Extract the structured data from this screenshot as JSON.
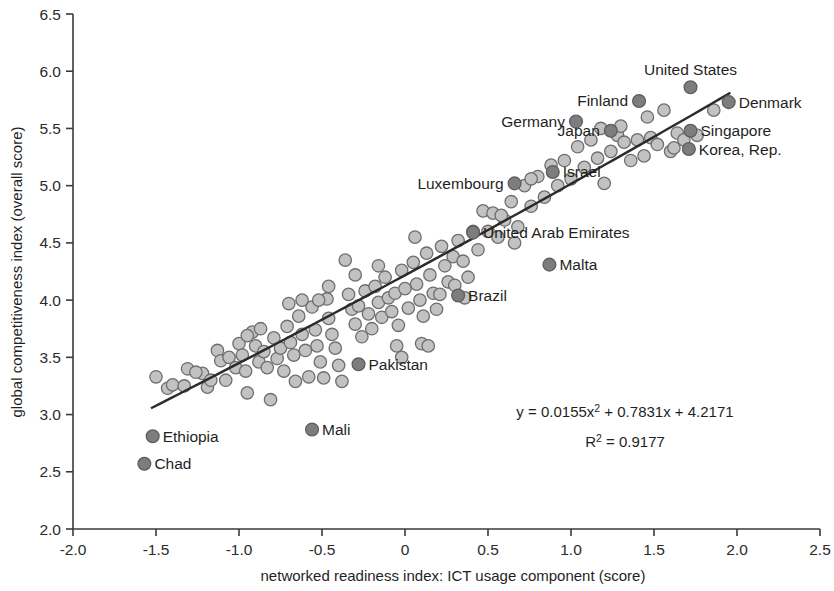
{
  "chart_data": {
    "type": "scatter",
    "title": "",
    "xlabel": "networked readiness index: ICT usage component (score)",
    "ylabel": "global competitiveness index (overall score)",
    "xlim": [
      -2.0,
      2.5
    ],
    "ylim": [
      2.0,
      6.5
    ],
    "xticks": [
      "-2.0",
      "-1.5",
      "-1.0",
      "-0.5",
      "0",
      "0.5",
      "1.0",
      "1.5",
      "2.0",
      "2.5"
    ],
    "xtick_values": [
      -2.0,
      -1.5,
      -1.0,
      -0.5,
      0,
      0.5,
      1.0,
      1.5,
      2.0,
      2.5
    ],
    "yticks": [
      "2.0",
      "2.5",
      "3.0",
      "3.5",
      "4.0",
      "4.5",
      "5.0",
      "5.5",
      "6.0",
      "6.5"
    ],
    "ytick_values": [
      2.0,
      2.5,
      3.0,
      3.5,
      4.0,
      4.5,
      5.0,
      5.5,
      6.0,
      6.5
    ],
    "grid": false,
    "legend": "none",
    "marker_color": "#c2c2c2",
    "marker_edge_color": "#6e6e6e",
    "highlight_color": "#7d7d7d",
    "trendline_color": "#2b2b2b",
    "trendline": {
      "equation": "y = 0.0155x",
      "equation_sup": "2",
      "equation_rest": " + 0.7831x + 4.2171",
      "r2_label": "R",
      "r2_sup": "2",
      "r2_value": " = 0.9177",
      "x_start": -1.53,
      "x_end": 1.96,
      "coefficients": {
        "a": 0.0155,
        "b": 0.7831,
        "c": 4.2171
      },
      "r_squared": 0.9177
    },
    "labeled_points": [
      {
        "label": "United States",
        "x": 1.72,
        "y": 5.86,
        "anchor": "above"
      },
      {
        "label": "Finland",
        "x": 1.41,
        "y": 5.74,
        "anchor": "left"
      },
      {
        "label": "Denmark",
        "x": 1.95,
        "y": 5.73,
        "anchor": "right"
      },
      {
        "label": "Germany",
        "x": 1.03,
        "y": 5.56,
        "anchor": "left"
      },
      {
        "label": "Japan",
        "x": 1.24,
        "y": 5.48,
        "anchor": "left"
      },
      {
        "label": "Singapore",
        "x": 1.72,
        "y": 5.48,
        "anchor": "right"
      },
      {
        "label": "Korea, Rep.",
        "x": 1.71,
        "y": 5.32,
        "anchor": "right"
      },
      {
        "label": "Israel",
        "x": 0.89,
        "y": 5.12,
        "anchor": "right"
      },
      {
        "label": "Luxembourg",
        "x": 0.66,
        "y": 5.02,
        "anchor": "left"
      },
      {
        "label": "United Arab Emirates",
        "x": 0.41,
        "y": 4.59,
        "anchor": "right"
      },
      {
        "label": "Malta",
        "x": 0.87,
        "y": 4.31,
        "anchor": "right"
      },
      {
        "label": "Brazil",
        "x": 0.32,
        "y": 4.04,
        "anchor": "right"
      },
      {
        "label": "Pakistan",
        "x": -0.28,
        "y": 3.44,
        "anchor": "right"
      },
      {
        "label": "Mali",
        "x": -0.56,
        "y": 2.87,
        "anchor": "right"
      },
      {
        "label": "Ethiopia",
        "x": -1.52,
        "y": 2.81,
        "anchor": "right"
      },
      {
        "label": "Chad",
        "x": -1.57,
        "y": 2.57,
        "anchor": "right"
      }
    ],
    "points": [
      {
        "x": -1.5,
        "y": 3.33
      },
      {
        "x": -1.43,
        "y": 3.23
      },
      {
        "x": -1.4,
        "y": 3.26
      },
      {
        "x": -1.33,
        "y": 3.25
      },
      {
        "x": -1.31,
        "y": 3.4
      },
      {
        "x": -1.22,
        "y": 3.36
      },
      {
        "x": -1.19,
        "y": 3.24
      },
      {
        "x": -1.17,
        "y": 3.3
      },
      {
        "x": -1.13,
        "y": 3.56
      },
      {
        "x": -1.11,
        "y": 3.47
      },
      {
        "x": -1.08,
        "y": 3.3
      },
      {
        "x": -1.06,
        "y": 3.5
      },
      {
        "x": -1.02,
        "y": 3.41
      },
      {
        "x": -1.0,
        "y": 3.62
      },
      {
        "x": -0.98,
        "y": 3.52
      },
      {
        "x": -0.96,
        "y": 3.38
      },
      {
        "x": -0.95,
        "y": 3.19
      },
      {
        "x": -0.92,
        "y": 3.72
      },
      {
        "x": -0.9,
        "y": 3.6
      },
      {
        "x": -0.88,
        "y": 3.46
      },
      {
        "x": -0.87,
        "y": 3.75
      },
      {
        "x": -0.85,
        "y": 3.55
      },
      {
        "x": -0.83,
        "y": 3.41
      },
      {
        "x": -0.81,
        "y": 3.13
      },
      {
        "x": -0.79,
        "y": 3.67
      },
      {
        "x": -0.77,
        "y": 3.49
      },
      {
        "x": -0.75,
        "y": 3.58
      },
      {
        "x": -0.73,
        "y": 3.38
      },
      {
        "x": -0.71,
        "y": 3.77
      },
      {
        "x": -0.69,
        "y": 3.63
      },
      {
        "x": -0.67,
        "y": 3.52
      },
      {
        "x": -0.66,
        "y": 3.29
      },
      {
        "x": -0.64,
        "y": 3.86
      },
      {
        "x": -0.62,
        "y": 3.7
      },
      {
        "x": -0.6,
        "y": 3.56
      },
      {
        "x": -0.58,
        "y": 3.33
      },
      {
        "x": -0.56,
        "y": 3.94
      },
      {
        "x": -0.54,
        "y": 3.74
      },
      {
        "x": -0.53,
        "y": 3.6
      },
      {
        "x": -0.51,
        "y": 3.46
      },
      {
        "x": -0.49,
        "y": 3.32
      },
      {
        "x": -0.47,
        "y": 4.01
      },
      {
        "x": -0.46,
        "y": 3.84
      },
      {
        "x": -0.44,
        "y": 3.7
      },
      {
        "x": -0.42,
        "y": 3.58
      },
      {
        "x": -0.4,
        "y": 3.43
      },
      {
        "x": -0.38,
        "y": 3.29
      },
      {
        "x": -0.36,
        "y": 4.35
      },
      {
        "x": -0.34,
        "y": 4.05
      },
      {
        "x": -0.32,
        "y": 3.92
      },
      {
        "x": -0.3,
        "y": 3.79
      },
      {
        "x": -0.28,
        "y": 3.95
      },
      {
        "x": -0.26,
        "y": 3.68
      },
      {
        "x": -0.24,
        "y": 4.08
      },
      {
        "x": -0.22,
        "y": 3.88
      },
      {
        "x": -0.2,
        "y": 3.75
      },
      {
        "x": -0.18,
        "y": 4.12
      },
      {
        "x": -0.16,
        "y": 3.98
      },
      {
        "x": -0.14,
        "y": 3.85
      },
      {
        "x": -0.12,
        "y": 4.2
      },
      {
        "x": -0.1,
        "y": 4.02
      },
      {
        "x": -0.08,
        "y": 3.9
      },
      {
        "x": -0.06,
        "y": 4.06
      },
      {
        "x": -0.04,
        "y": 3.78
      },
      {
        "x": -0.02,
        "y": 4.26
      },
      {
        "x": 0.0,
        "y": 4.1
      },
      {
        "x": 0.02,
        "y": 3.93
      },
      {
        "x": 0.05,
        "y": 4.33
      },
      {
        "x": 0.07,
        "y": 4.14
      },
      {
        "x": 0.09,
        "y": 4.0
      },
      {
        "x": 0.11,
        "y": 3.86
      },
      {
        "x": 0.13,
        "y": 4.41
      },
      {
        "x": 0.15,
        "y": 4.22
      },
      {
        "x": 0.17,
        "y": 4.06
      },
      {
        "x": 0.19,
        "y": 3.92
      },
      {
        "x": 0.22,
        "y": 4.47
      },
      {
        "x": 0.24,
        "y": 4.3
      },
      {
        "x": 0.26,
        "y": 4.16
      },
      {
        "x": 0.29,
        "y": 4.38
      },
      {
        "x": 0.32,
        "y": 4.52
      },
      {
        "x": 0.35,
        "y": 4.34
      },
      {
        "x": 0.38,
        "y": 4.2
      },
      {
        "x": 0.41,
        "y": 4.6
      },
      {
        "x": 0.44,
        "y": 4.44
      },
      {
        "x": 0.47,
        "y": 4.78
      },
      {
        "x": 0.5,
        "y": 4.6
      },
      {
        "x": 0.53,
        "y": 4.76
      },
      {
        "x": 0.56,
        "y": 4.55
      },
      {
        "x": 0.6,
        "y": 4.7
      },
      {
        "x": 0.64,
        "y": 4.86
      },
      {
        "x": 0.68,
        "y": 4.64
      },
      {
        "x": 0.72,
        "y": 5.0
      },
      {
        "x": 0.76,
        "y": 4.82
      },
      {
        "x": 0.8,
        "y": 5.08
      },
      {
        "x": 0.84,
        "y": 4.9
      },
      {
        "x": 0.88,
        "y": 5.18
      },
      {
        "x": 0.92,
        "y": 5.0
      },
      {
        "x": 0.96,
        "y": 5.22
      },
      {
        "x": 1.0,
        "y": 5.06
      },
      {
        "x": 1.04,
        "y": 5.34
      },
      {
        "x": 1.08,
        "y": 5.16
      },
      {
        "x": 1.12,
        "y": 5.4
      },
      {
        "x": 1.16,
        "y": 5.24
      },
      {
        "x": 1.2,
        "y": 5.02
      },
      {
        "x": 1.24,
        "y": 5.3
      },
      {
        "x": 1.28,
        "y": 5.44
      },
      {
        "x": 1.32,
        "y": 5.38
      },
      {
        "x": 1.36,
        "y": 5.22
      },
      {
        "x": 1.4,
        "y": 5.4
      },
      {
        "x": 1.44,
        "y": 5.26
      },
      {
        "x": 1.48,
        "y": 5.42
      },
      {
        "x": 1.52,
        "y": 5.36
      },
      {
        "x": 1.56,
        "y": 5.66
      },
      {
        "x": 1.6,
        "y": 5.3
      },
      {
        "x": 1.64,
        "y": 5.46
      },
      {
        "x": 1.68,
        "y": 5.4
      },
      {
        "x": 1.76,
        "y": 5.44
      },
      {
        "x": 1.86,
        "y": 5.66
      },
      {
        "x": -1.26,
        "y": 3.37
      },
      {
        "x": -0.95,
        "y": 3.69
      },
      {
        "x": -0.62,
        "y": 4.0
      },
      {
        "x": -0.3,
        "y": 4.22
      },
      {
        "x": 0.06,
        "y": 4.55
      },
      {
        "x": -0.7,
        "y": 3.97
      },
      {
        "x": -0.52,
        "y": 4.0
      },
      {
        "x": -0.46,
        "y": 4.12
      },
      {
        "x": -0.16,
        "y": 4.3
      },
      {
        "x": 0.3,
        "y": 4.13
      },
      {
        "x": 0.36,
        "y": 4.02
      },
      {
        "x": 0.21,
        "y": 4.05
      },
      {
        "x": -0.05,
        "y": 3.6
      },
      {
        "x": 0.1,
        "y": 3.62
      },
      {
        "x": 0.14,
        "y": 3.6
      },
      {
        "x": -0.02,
        "y": 3.5
      },
      {
        "x": 0.58,
        "y": 4.74
      },
      {
        "x": 0.66,
        "y": 4.5
      },
      {
        "x": 0.76,
        "y": 5.06
      },
      {
        "x": 1.18,
        "y": 5.5
      },
      {
        "x": 1.3,
        "y": 5.52
      },
      {
        "x": 1.46,
        "y": 5.6
      },
      {
        "x": 1.62,
        "y": 5.33
      }
    ]
  }
}
